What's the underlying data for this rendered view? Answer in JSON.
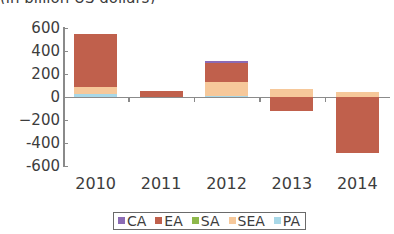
{
  "chart_data": {
    "type": "bar",
    "title": "(in billion US dollars)",
    "subtitle": "",
    "xlabel": "",
    "ylabel": "",
    "stacked": true,
    "grid": false,
    "legend_position": "bottom",
    "ylim": [
      -600,
      600
    ],
    "yticks": [
      600,
      400,
      200,
      0,
      -200,
      -400,
      -600
    ],
    "ytick_labels": [
      "600",
      "400",
      "200",
      "0",
      "−200",
      "-400",
      "-600"
    ],
    "categories": [
      "2010",
      "2011",
      "2012",
      "2013",
      "2014"
    ],
    "series": [
      {
        "name": "CA",
        "color": "#8b6bb5",
        "values": [
          0,
          0,
          20,
          0,
          0
        ]
      },
      {
        "name": "EA",
        "color": "#c0604c",
        "values": [
          460,
          55,
          165,
          -120,
          -490
        ]
      },
      {
        "name": "SA",
        "color": "#8eb84b",
        "values": [
          0,
          0,
          0,
          0,
          0
        ]
      },
      {
        "name": "SEA",
        "color": "#f6c89a",
        "values": [
          60,
          0,
          120,
          70,
          40
        ]
      },
      {
        "name": "PA",
        "color": "#a8d8e8",
        "values": [
          25,
          0,
          8,
          0,
          0
        ]
      }
    ],
    "totals_positive": [
      545,
      55,
      305,
      70,
      40
    ],
    "totals_negative": [
      0,
      0,
      0,
      -120,
      -490
    ]
  },
  "legend": {
    "items": [
      {
        "label": "CA",
        "color": "#8b6bb5"
      },
      {
        "label": "EA",
        "color": "#c0604c"
      },
      {
        "label": "SA",
        "color": "#8eb84b"
      },
      {
        "label": "SEA",
        "color": "#f6c89a"
      },
      {
        "label": "PA",
        "color": "#a8d8e8"
      }
    ]
  },
  "axis": {
    "line_color": "#8a8a8a",
    "text_color": "#3d3d3d"
  }
}
